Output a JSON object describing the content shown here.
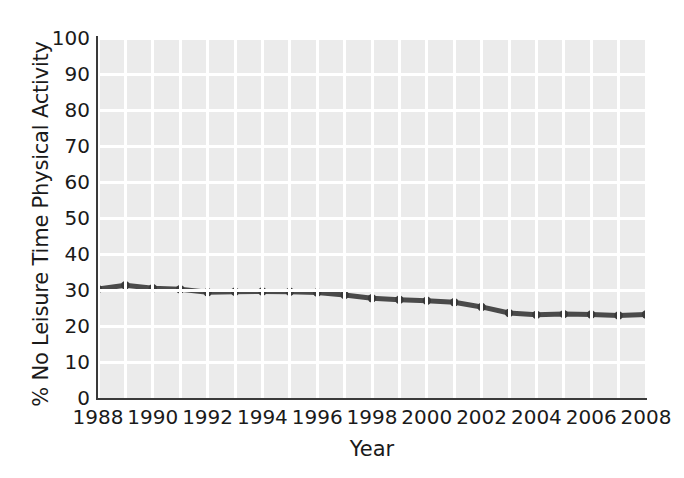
{
  "chart_data": {
    "type": "line",
    "title": "",
    "subtitle": "",
    "xlabel": "Year",
    "ylabel": "% No Leisure Time Physical Activity",
    "xlim": [
      1988,
      2008
    ],
    "ylim": [
      0,
      100
    ],
    "grid": true,
    "legend": null,
    "ytick_labels": [
      "100",
      "90",
      "80",
      "70",
      "60",
      "50",
      "40",
      "30",
      "20",
      "10",
      "0"
    ],
    "ytick_values": [
      100,
      90,
      80,
      70,
      60,
      50,
      40,
      30,
      20,
      10,
      0
    ],
    "xtick_labels": [
      "1988",
      "1990",
      "1992",
      "1994",
      "1996",
      "1998",
      "2000",
      "2002",
      "2004",
      "2006",
      "2008"
    ],
    "xtick_values": [
      1988,
      1990,
      1992,
      1994,
      1996,
      1998,
      2000,
      2002,
      2004,
      2006,
      2008
    ],
    "x": [
      1988,
      1989,
      1990,
      1991,
      1992,
      1993,
      1994,
      1995,
      1996,
      1997,
      1998,
      1999,
      2000,
      2001,
      2002,
      2003,
      2004,
      2005,
      2006,
      2007,
      2008
    ],
    "values": [
      30.3,
      31.3,
      30.5,
      30.2,
      29.4,
      29.5,
      29.6,
      29.5,
      29.3,
      28.6,
      27.7,
      27.3,
      27.0,
      26.6,
      25.3,
      23.6,
      23.1,
      23.3,
      23.2,
      22.9,
      23.2
    ],
    "series": [
      {
        "name": "% No Leisure Time Physical Activity",
        "color": "#4a4a4a",
        "marker": "circle",
        "values": [
          30.3,
          31.3,
          30.5,
          30.2,
          29.4,
          29.5,
          29.6,
          29.5,
          29.3,
          28.6,
          27.7,
          27.3,
          27.0,
          26.6,
          25.3,
          23.6,
          23.1,
          23.3,
          23.2,
          22.9,
          23.2
        ]
      }
    ],
    "colors": {
      "plot_background": "#ebebeb",
      "gridline": "#ffffff",
      "axis": "#3a3a3a",
      "line": "#4a4a4a",
      "text": "#1a1a1a"
    }
  }
}
